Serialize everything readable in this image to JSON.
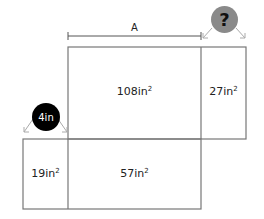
{
  "diagram": {
    "dimension_label": "A",
    "unknown_marker": "?",
    "known_marker": "4in",
    "regions": [
      {
        "id": "top-left",
        "value": "108in",
        "exp": "2"
      },
      {
        "id": "top-right",
        "value": "27in",
        "exp": "2"
      },
      {
        "id": "bottom-left",
        "value": "19in",
        "exp": "2"
      },
      {
        "id": "bottom-right",
        "value": "57in",
        "exp": "2"
      }
    ],
    "colors": {
      "line": "#777777",
      "unknown_circle": "#8a8a8a",
      "known_circle": "#000000"
    }
  }
}
